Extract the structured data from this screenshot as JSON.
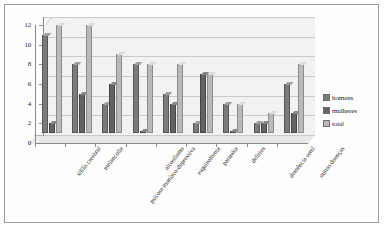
{
  "chart_data": {
    "type": "bar",
    "title": "",
    "subtitle": "",
    "xlabel": "",
    "ylabel": "",
    "ylim": [
      0,
      12
    ],
    "yticks": [
      0,
      2,
      4,
      6,
      8,
      10,
      12
    ],
    "grid": true,
    "legend_position": "right",
    "categories": [
      "sífilis cerebral",
      "melancolia",
      "psicose maníaco-depressiva",
      "alcoolismo",
      "esquizofrenia",
      "paranóia",
      "delírios",
      "demência senil",
      "outras doenças"
    ],
    "series": [
      {
        "name": "homens",
        "color": "#7b7b7b",
        "values": [
          10,
          7,
          3,
          7,
          4,
          1,
          3,
          1,
          5
        ]
      },
      {
        "name": "mulheres",
        "color": "#636363",
        "values": [
          1,
          4,
          5,
          0,
          3,
          6,
          0,
          1,
          2
        ]
      },
      {
        "name": "total",
        "color": "#b9b9b9",
        "values": [
          11,
          11,
          8,
          7,
          7,
          6,
          3,
          2,
          7
        ]
      }
    ]
  },
  "legend": {
    "items": [
      {
        "label": "homens"
      },
      {
        "label": "mulheres"
      },
      {
        "label": "total"
      }
    ]
  }
}
